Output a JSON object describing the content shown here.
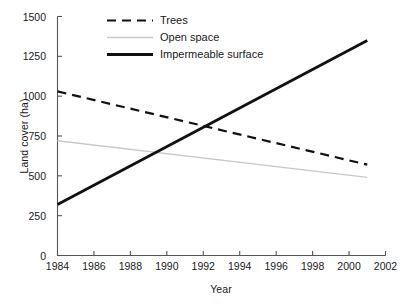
{
  "chart_data": {
    "type": "line",
    "title": "",
    "xlabel": "Year",
    "ylabel": "Land cover (ha)",
    "xlim": [
      1984,
      2002
    ],
    "ylim": [
      0,
      1500
    ],
    "xticks": [
      1984,
      1986,
      1988,
      1990,
      1992,
      1994,
      1996,
      1998,
      2000,
      2002
    ],
    "yticks": [
      0,
      250,
      500,
      750,
      1000,
      1250,
      1500
    ],
    "grid": false,
    "legend_position": "top-left-inside",
    "x": [
      1984,
      2001
    ],
    "series": [
      {
        "name": "Trees",
        "style": "dashed",
        "color": "#111111",
        "width": 2.2,
        "values": [
          1030,
          570
        ]
      },
      {
        "name": "Open space",
        "style": "solid",
        "color": "#c9c9c9",
        "width": 1.4,
        "values": [
          720,
          490
        ]
      },
      {
        "name": "Impermeable surface",
        "style": "solid",
        "color": "#111111",
        "width": 2.8,
        "values": [
          320,
          1350
        ]
      }
    ],
    "annotations": []
  },
  "axes": {
    "ylabel": "Land cover (ha)",
    "xlabel": "Year",
    "ytick_labels": [
      "1500",
      "1250",
      "1000",
      "750",
      "500",
      "250",
      "0"
    ],
    "xtick_labels": [
      "1984",
      "1986",
      "1988",
      "1990",
      "1992",
      "1994",
      "1996",
      "1998",
      "2000",
      "2002"
    ]
  },
  "legend": {
    "items": [
      {
        "label": "Trees"
      },
      {
        "label": "Open space"
      },
      {
        "label": "Impermeable surface"
      }
    ]
  },
  "colors": {
    "axis": "#555555",
    "text": "#1a1a1a",
    "trees": "#111111",
    "open_space": "#c9c9c9",
    "impermeable": "#111111",
    "background": "#ffffff"
  }
}
